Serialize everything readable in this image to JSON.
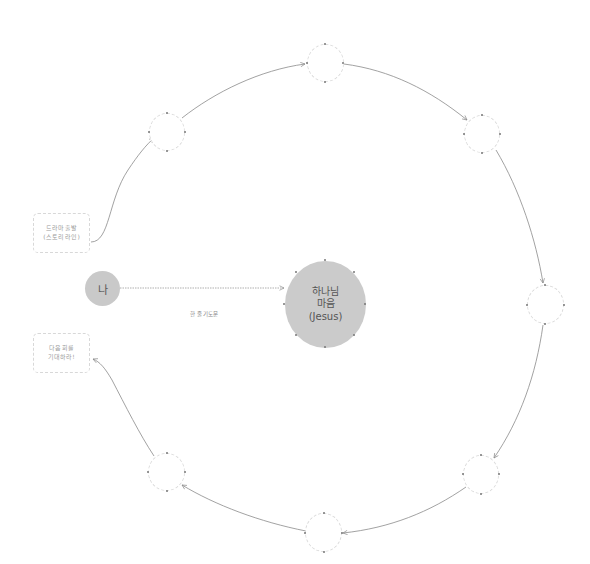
{
  "diagram": {
    "center_node": {
      "lines": [
        "하나님",
        "마음",
        "(Jesus)"
      ],
      "fill": "#cbcbcb"
    },
    "me_node": {
      "label": "나",
      "fill": "#c9c9c9"
    },
    "connector_label": "한 줄 기도문",
    "start_box": {
      "lines": [
        "드라마 출발",
        "(스토리 라인)"
      ]
    },
    "end_box": {
      "lines": [
        "다음 회를",
        "기대하라!"
      ]
    },
    "orbit_nodes": [
      {
        "id": "upper-left",
        "label": ""
      },
      {
        "id": "top",
        "label": ""
      },
      {
        "id": "upper-right",
        "label": ""
      },
      {
        "id": "right",
        "label": ""
      },
      {
        "id": "lower-right",
        "label": ""
      },
      {
        "id": "bottom",
        "label": ""
      },
      {
        "id": "lower-left",
        "label": ""
      }
    ],
    "colors": {
      "arrow": "#8a8a8a",
      "node_border": "#dcdcdc",
      "connector": "#9a9a9a"
    }
  }
}
